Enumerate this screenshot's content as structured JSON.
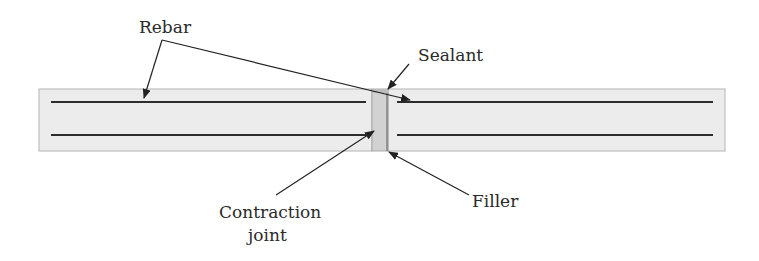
{
  "diagram": {
    "type": "cross-section",
    "labels": {
      "rebar": "Rebar",
      "sealant": "Sealant",
      "contraction_joint_line1": "Contraction",
      "contraction_joint_line2": "joint",
      "filler": "Filler"
    },
    "colors": {
      "slab_fill": "#ececec",
      "slab_border": "#b4b4b4",
      "rebar": "#2c2c2c",
      "joint_fill": "#d2d2d2",
      "joint_edge": "#8a8a8a",
      "sealant_fill": "#bdbdbd",
      "leader": "#222222"
    }
  }
}
